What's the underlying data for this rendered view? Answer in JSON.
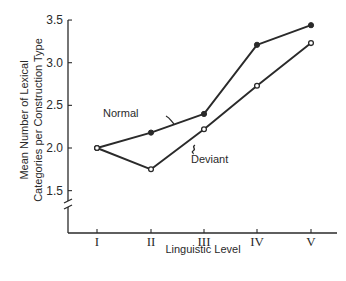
{
  "chart_data": {
    "type": "line",
    "title": "",
    "xlabel": "Linguistic Level",
    "ylabel": [
      "Mean Number of Lexical",
      "Categories per Construction Type"
    ],
    "categories": [
      "I",
      "II",
      "III",
      "IV",
      "V"
    ],
    "yticks": [
      "1.5",
      "2.0",
      "2.5",
      "3.0",
      "3.5"
    ],
    "ylim": [
      1.5,
      3.5
    ],
    "y_axis_break": true,
    "grid": false,
    "series": [
      {
        "name": "Normal",
        "marker": "filled-circle",
        "values": [
          2.0,
          2.18,
          2.4,
          3.21,
          3.44
        ]
      },
      {
        "name": "Deviant",
        "marker": "open-circle",
        "values": [
          2.0,
          1.75,
          2.22,
          2.73,
          3.23
        ]
      }
    ],
    "annotations": [
      {
        "text": "Normal",
        "points_to": "Normal series between II and III"
      },
      {
        "text": "Deviant",
        "points_to": "Deviant series between II and III"
      }
    ]
  }
}
